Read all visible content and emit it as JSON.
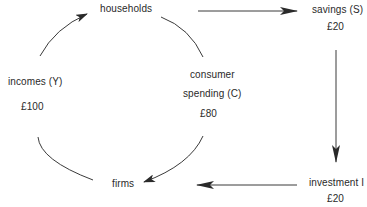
{
  "diagram": {
    "title": "",
    "nodes": {
      "households": {
        "label": "households"
      },
      "savings": {
        "label": "savings (S)",
        "value": "£20"
      },
      "incomes": {
        "label": "incomes (Y)",
        "value": "£100"
      },
      "consumer_spending": {
        "label_line1": "consumer",
        "label_line2": "spending (C)",
        "value": "£80"
      },
      "firms": {
        "label": "firms"
      },
      "investment": {
        "label": "investment I",
        "value": "£20"
      }
    },
    "edges": [
      {
        "from": "firms",
        "to": "households",
        "label": "incomes (Y) £100"
      },
      {
        "from": "households",
        "to": "firms",
        "label": "consumer spending (C) £80"
      },
      {
        "from": "households",
        "to": "savings"
      },
      {
        "from": "savings",
        "to": "investment"
      },
      {
        "from": "investment",
        "to": "firms"
      }
    ],
    "colors": {
      "line": "#3a3a3a",
      "text": "#2a2a2a",
      "background": "#ffffff"
    }
  }
}
